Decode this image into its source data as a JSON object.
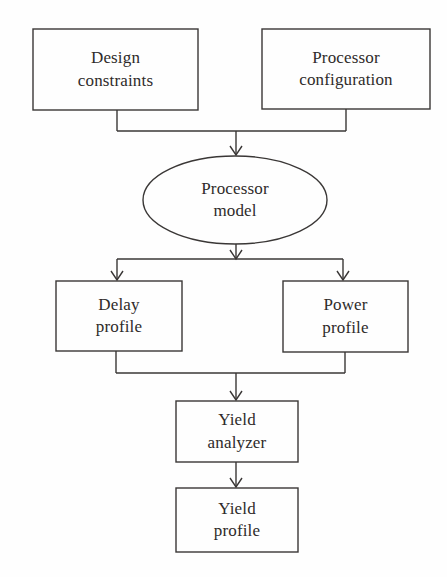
{
  "diagram": {
    "type": "flowchart",
    "canvas": {
      "width": 447,
      "height": 577,
      "background": "#fefefe"
    },
    "style": {
      "stroke_color": "#3a3736",
      "stroke_width": 1.4,
      "text_color": "#2e2b2a",
      "arrow_style": "open-chevron"
    },
    "nodes": [
      {
        "id": "design-constraints",
        "shape": "rectangle",
        "lines": [
          "Design",
          "constraints"
        ],
        "line1": "Design",
        "line2": "constraints",
        "x": 33,
        "y": 29,
        "w": 165,
        "h": 81
      },
      {
        "id": "processor-configuration",
        "shape": "rectangle",
        "lines": [
          "Processor",
          "configuration"
        ],
        "line1": "Processor",
        "line2": "configuration",
        "x": 262,
        "y": 29,
        "w": 168,
        "h": 80
      },
      {
        "id": "processor-model",
        "shape": "ellipse",
        "lines": [
          "Processor",
          "model"
        ],
        "line1": "Processor",
        "line2": "model",
        "x": 143,
        "y": 156,
        "w": 184,
        "h": 88
      },
      {
        "id": "delay-profile",
        "shape": "rectangle",
        "lines": [
          "Delay",
          "profile"
        ],
        "line1": "Delay",
        "line2": "profile",
        "x": 56,
        "y": 281,
        "w": 126,
        "h": 70
      },
      {
        "id": "power-profile",
        "shape": "rectangle",
        "lines": [
          "Power",
          "profile"
        ],
        "line1": "Power",
        "line2": "profile",
        "x": 283,
        "y": 281,
        "w": 125,
        "h": 71
      },
      {
        "id": "yield-analyzer",
        "shape": "rectangle",
        "lines": [
          "Yield",
          "analyzer"
        ],
        "line1": "Yield",
        "line2": "analyzer",
        "x": 176,
        "y": 401,
        "w": 122,
        "h": 61
      },
      {
        "id": "yield-profile",
        "shape": "rectangle",
        "lines": [
          "Yield",
          "profile"
        ],
        "line1": "Yield",
        "line2": "profile",
        "x": 176,
        "y": 488,
        "w": 122,
        "h": 64
      }
    ],
    "edges": [
      {
        "id": "edge-design-constraints-to-processor-model",
        "from": "design-constraints",
        "to": "processor-model",
        "kind": "merge",
        "arrow": true
      },
      {
        "id": "edge-processor-configuration-to-processor-model",
        "from": "processor-configuration",
        "to": "processor-model",
        "kind": "merge",
        "arrow": true
      },
      {
        "id": "edge-processor-model-to-delay-profile",
        "from": "processor-model",
        "to": "delay-profile",
        "kind": "split",
        "arrow": true
      },
      {
        "id": "edge-processor-model-to-power-profile",
        "from": "processor-model",
        "to": "power-profile",
        "kind": "split",
        "arrow": true
      },
      {
        "id": "edge-delay-profile-to-yield-analyzer",
        "from": "delay-profile",
        "to": "yield-analyzer",
        "kind": "merge",
        "arrow": true
      },
      {
        "id": "edge-power-profile-to-yield-analyzer",
        "from": "power-profile",
        "to": "yield-analyzer",
        "kind": "merge",
        "arrow": true
      },
      {
        "id": "edge-yield-analyzer-to-yield-profile",
        "from": "yield-analyzer",
        "to": "yield-profile",
        "kind": "direct",
        "arrow": true
      }
    ]
  }
}
